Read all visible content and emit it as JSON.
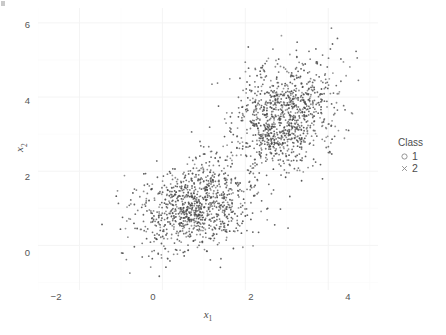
{
  "chart_data": {
    "type": "scatter",
    "title": "",
    "subtitle": "",
    "xlabel": "x_1",
    "ylabel": "x_2",
    "xlabel_base": "x",
    "xlabel_sub": "1",
    "ylabel_base": "x",
    "ylabel_sub": "2",
    "xticks": [
      -2,
      0,
      2,
      4
    ],
    "xtick_labels": [
      "−2",
      "0",
      "2",
      "4"
    ],
    "yticks": [
      0,
      2,
      4,
      6
    ],
    "ytick_labels": [
      "0",
      "2",
      "4",
      "6"
    ],
    "xlim": [
      -3.0,
      5.2
    ],
    "ylim": [
      -1.2,
      6.4
    ],
    "grid": true,
    "grid_color": "#f2f2f2",
    "panel_background": "#ffffff",
    "point_color": "#4a4a4a",
    "point_size_px": 1.8,
    "legend": {
      "title": "Class",
      "position": "right",
      "entries": [
        {
          "label": "1",
          "marker": "circle-open-icon",
          "color": "#6b6b6b"
        },
        {
          "label": "2",
          "marker": "cross-icon",
          "color": "#6b6b6b"
        }
      ]
    },
    "series": [
      {
        "name": "1",
        "marker": "circle",
        "n": 1000,
        "center": [
          0.8,
          1.05
        ],
        "sd": [
          0.72,
          0.62
        ],
        "correlation": 0.25,
        "seed": 20240517
      },
      {
        "name": "2",
        "marker": "cross",
        "n": 1000,
        "center": [
          2.95,
          3.5
        ],
        "sd": [
          0.62,
          0.72
        ],
        "correlation": 0.2,
        "seed": 77310214
      }
    ]
  }
}
